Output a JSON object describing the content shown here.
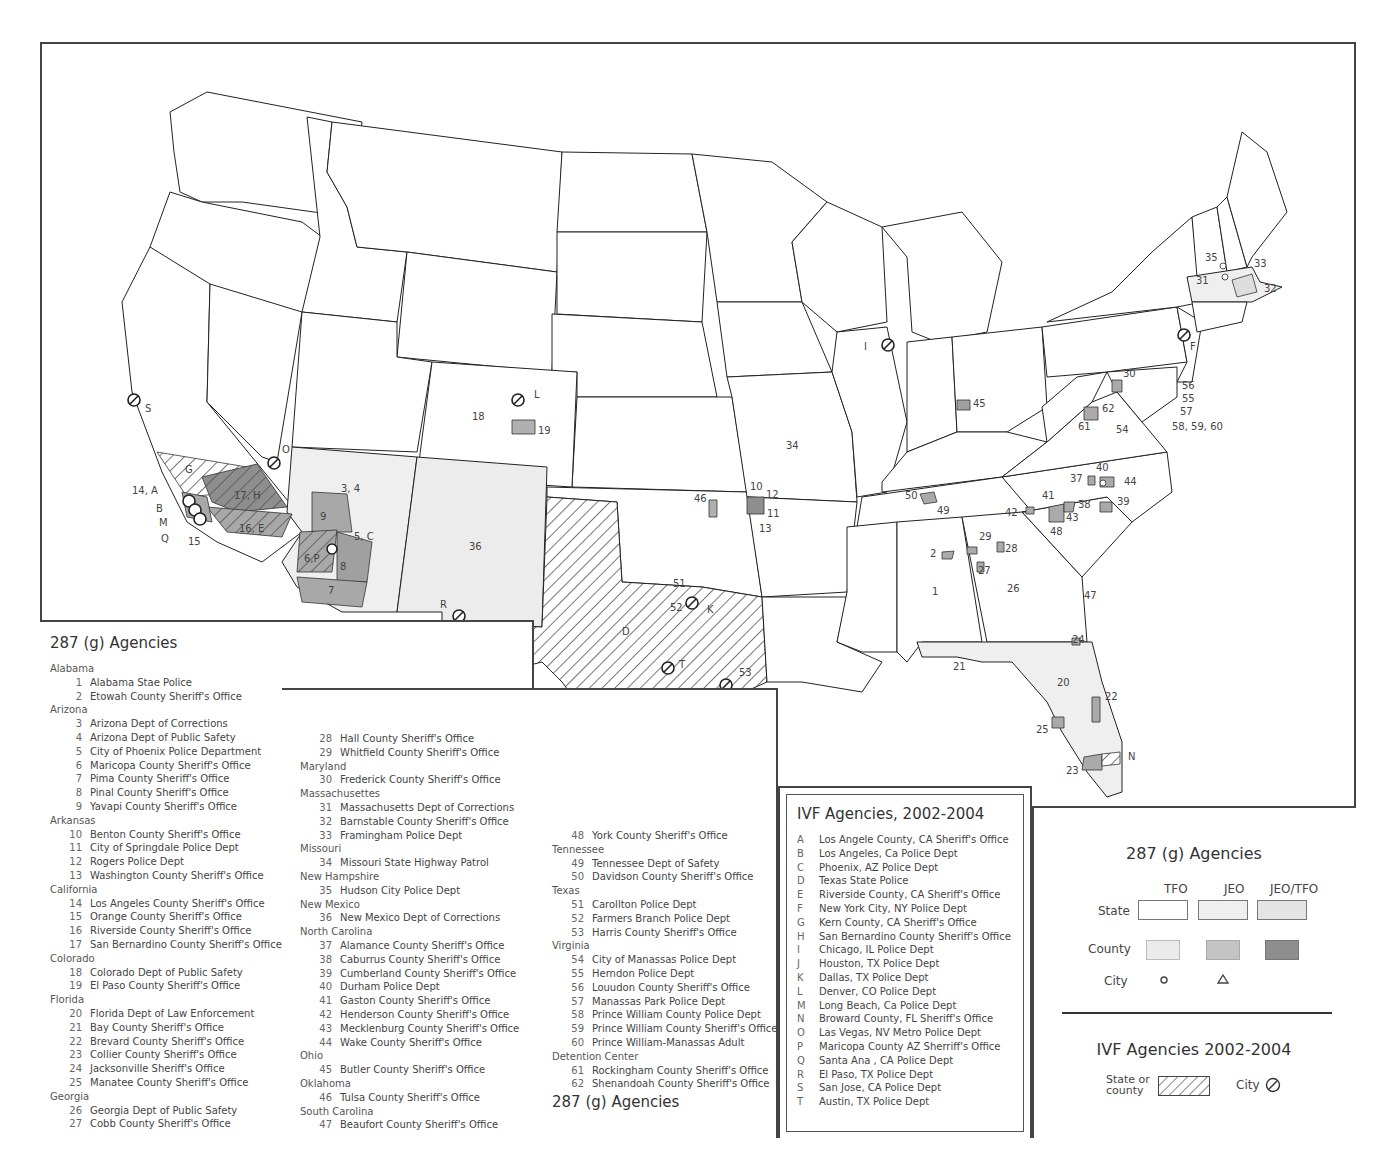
{
  "map": {
    "state_labels": {
      "n18": "18",
      "n19": "19",
      "n36": "36",
      "n34": "34",
      "n3_4": "3, 4",
      "n9": "9",
      "n5C": "5, C",
      "n6P": "6,P",
      "n8": "8",
      "n7": "7",
      "n17H": "17, H",
      "n16E": "16, E",
      "G": "G",
      "n14A": "14, A",
      "B": "B",
      "M": "M",
      "Q": "Q",
      "n15": "15",
      "S": "S",
      "O": "O",
      "L": "L",
      "R": "R",
      "D": "D",
      "T": "T",
      "J": "J",
      "K": "K",
      "n51": "51",
      "n52": "52",
      "n53": "53",
      "n46": "46",
      "n10": "10",
      "n11": "11",
      "n12": "12",
      "n13": "13",
      "I": "I",
      "n45": "45",
      "n1": "1",
      "n2": "2",
      "n26": "26",
      "n27": "27",
      "n28": "28",
      "n29": "29",
      "n49": "49",
      "n50": "50",
      "n42": "42",
      "n41": "41",
      "n43": "43",
      "n48": "48",
      "n38": "38",
      "n37": "37",
      "n40": "40",
      "n44": "44",
      "n39": "39",
      "n47": "47",
      "n20": "20",
      "n21": "21",
      "n22": "22",
      "n23": "23",
      "n24": "24",
      "n25": "25",
      "N": "N",
      "n30": "30",
      "n61": "61",
      "n62": "62",
      "n54": "54",
      "n55": "55",
      "n56": "56",
      "n57": "57",
      "n58_60": "58, 59, 60",
      "F": "F",
      "n31": "31",
      "n32": "32",
      "n33": "33",
      "n35": "35"
    }
  },
  "agencies_287g": {
    "title": "287 (g) Agencies",
    "footer_title": "287 (g) Agencies",
    "columns": [
      [
        {
          "state": "Alabama"
        },
        {
          "num": "1",
          "name": "Alabama Stae Police"
        },
        {
          "num": "2",
          "name": "Etowah County Sheriff's Office"
        },
        {
          "state": "Arizona"
        },
        {
          "num": "3",
          "name": "Arizona Dept of Corrections"
        },
        {
          "num": "4",
          "name": "Arizona Dept of Public Safety"
        },
        {
          "num": "5",
          "name": "City of Phoenix Police Department"
        },
        {
          "num": "6",
          "name": "Maricopa County Sheriff's Office"
        },
        {
          "num": "7",
          "name": "Pima County Sheriff's Office"
        },
        {
          "num": "8",
          "name": "Pinal County Sheriff's Office"
        },
        {
          "num": "9",
          "name": "Yavapi County Sheriff's Office"
        },
        {
          "state": "Arkansas"
        },
        {
          "num": "10",
          "name": "Benton County Sheriff's Office"
        },
        {
          "num": "11",
          "name": "City of Springdale Police Dept"
        },
        {
          "num": "12",
          "name": "Rogers Police Dept"
        },
        {
          "num": "13",
          "name": "Washington County Sheriff's Office"
        },
        {
          "state": "California"
        },
        {
          "num": "14",
          "name": "Los Angeles County Sheriff's Office"
        },
        {
          "num": "15",
          "name": "Orange County Sheriff's Office"
        },
        {
          "num": "16",
          "name": "Riverside County Sheriff's Office"
        },
        {
          "num": "17",
          "name": "San Bernardino County Sheriff's Office"
        },
        {
          "state": "Colorado"
        },
        {
          "num": "18",
          "name": "Colorado Dept of Public Safety"
        },
        {
          "num": "19",
          "name": "El Paso County Sheriff's Office"
        },
        {
          "state": "Florida"
        },
        {
          "num": "20",
          "name": "Florida Dept of Law Enforcement"
        },
        {
          "num": "21",
          "name": "Bay County Sheriff's Office"
        },
        {
          "num": "22",
          "name": "Brevard County Sheriff's Office"
        },
        {
          "num": "23",
          "name": "Collier County Sheriff's Office"
        },
        {
          "num": "24",
          "name": "Jacksonville Sheriff's Office"
        },
        {
          "num": "25",
          "name": "Manatee County Sheriff's Office"
        },
        {
          "state": "Georgia"
        },
        {
          "num": "26",
          "name": "Georgia Dept of Public Safety"
        },
        {
          "num": "27",
          "name": "Cobb County Sheriff's Office"
        }
      ],
      [
        {
          "num": "28",
          "name": "Hall County Sheriff's Office"
        },
        {
          "num": "29",
          "name": "Whitfield County Sheriff's Office"
        },
        {
          "state": "Maryland"
        },
        {
          "num": "30",
          "name": "Frederick County Sheriff's Office"
        },
        {
          "state": "Massachusettes"
        },
        {
          "num": "31",
          "name": "Massachusetts Dept of Corrections"
        },
        {
          "num": "32",
          "name": "Barnstable County Sheriff's Office"
        },
        {
          "num": "33",
          "name": "Framingham Police Dept"
        },
        {
          "state": "Missouri"
        },
        {
          "num": "34",
          "name": "Missouri State Highway Patrol"
        },
        {
          "state": "New Hampshire"
        },
        {
          "num": "35",
          "name": "Hudson City Police Dept"
        },
        {
          "state": "New Mexico"
        },
        {
          "num": "36",
          "name": "New Mexico Dept of Corrections"
        },
        {
          "state": "North Carolina"
        },
        {
          "num": "37",
          "name": "Alamance County Sheriff's Office"
        },
        {
          "num": "38",
          "name": "Caburrus County Sheriff's Office"
        },
        {
          "num": "39",
          "name": "Cumberland County Sheriff's Office"
        },
        {
          "num": "40",
          "name": "Durham Police Dept"
        },
        {
          "num": "41",
          "name": "Gaston County Sheriff's Office"
        },
        {
          "num": "42",
          "name": "Henderson County Sheriff's Office"
        },
        {
          "num": "43",
          "name": "Mecklenburg County Sheriff's Office"
        },
        {
          "num": "44",
          "name": "Wake County Sheriff's Office"
        },
        {
          "state": "Ohio"
        },
        {
          "num": "45",
          "name": "Butler County Sheriff's Office"
        },
        {
          "state": "Oklahoma"
        },
        {
          "num": "46",
          "name": "Tulsa County Sheriff's Office"
        },
        {
          "state": "South Carolina"
        },
        {
          "num": "47",
          "name": "Beaufort County Sheriff's Office"
        }
      ],
      [
        {
          "num": "48",
          "name": "York County Sheriff's Office"
        },
        {
          "state": "Tennessee"
        },
        {
          "num": "49",
          "name": "Tennessee Dept of Safety"
        },
        {
          "num": "50",
          "name": "Davidson County Sheriff's Office"
        },
        {
          "state": "Texas"
        },
        {
          "num": "51",
          "name": "Carollton Police Dept"
        },
        {
          "num": "52",
          "name": "Farmers Branch Police Dept"
        },
        {
          "num": "53",
          "name": "Harris County Sheriff's Office"
        },
        {
          "state": "Virginia"
        },
        {
          "num": "54",
          "name": "City of Manassas Police Dept"
        },
        {
          "num": "55",
          "name": "Herndon Police Dept"
        },
        {
          "num": "56",
          "name": "Louudon County Sheriff's Office"
        },
        {
          "num": "57",
          "name": "Manassas Park Police Dept"
        },
        {
          "num": "58",
          "name": "Prince William County Police Dept"
        },
        {
          "num": "59",
          "name": "Prince William County Sheriff's Office"
        },
        {
          "num": "60",
          "name": "Prince William-Manassas Adult"
        },
        {
          "state": "Detention Center"
        },
        {
          "num": "61",
          "name": "Rockingham County Sheriff's Office"
        },
        {
          "num": "62",
          "name": "Shenandoah County Sheriff's Office"
        }
      ]
    ]
  },
  "ivf_agencies": {
    "title": "IVF Agencies, 2002-2004",
    "items": [
      {
        "letter": "A",
        "name": "Los Angele County, CA Sheriff's Office"
      },
      {
        "letter": "B",
        "name": "Los Angeles, Ca Police Dept"
      },
      {
        "letter": "C",
        "name": "Phoenix, AZ Police Dept"
      },
      {
        "letter": "D",
        "name": "Texas State Police"
      },
      {
        "letter": "E",
        "name": "Riverside County, CA Sheriff's Office"
      },
      {
        "letter": "F",
        "name": "New York City, NY Police Dept"
      },
      {
        "letter": "G",
        "name": "Kern County, CA Sheriff's Office"
      },
      {
        "letter": "H",
        "name": "San Bernardino County Sheriff's Office"
      },
      {
        "letter": "I",
        "name": "Chicago, IL Police Dept"
      },
      {
        "letter": "J",
        "name": "Houston, TX Police Dept"
      },
      {
        "letter": "K",
        "name": "Dallas, TX Police Dept"
      },
      {
        "letter": "L",
        "name": "Denver, CO Police Dept"
      },
      {
        "letter": "M",
        "name": "Long Beach, Ca Police Dept"
      },
      {
        "letter": "N",
        "name": "Broward County, FL Sheriff's Office"
      },
      {
        "letter": "O",
        "name": "Las Vegas, NV Metro Police Dept"
      },
      {
        "letter": "P",
        "name": "Maricopa County AZ Sherriff's Office"
      },
      {
        "letter": "Q",
        "name": "Santa Ana , CA Police Dept"
      },
      {
        "letter": "R",
        "name": "El Paso, TX Police Dept"
      },
      {
        "letter": "S",
        "name": "San Jose, CA Police Dept"
      },
      {
        "letter": "T",
        "name": "Austin, TX Police Dept"
      }
    ]
  },
  "legend": {
    "title_287g": "287 (g) Agencies",
    "col_headers": [
      "TFO",
      "JEO",
      "JEO/TFO"
    ],
    "row_labels": [
      "State",
      "County",
      "City"
    ],
    "colors": {
      "state_tfo": "#ffffff",
      "state_jeo": "#efefef",
      "state_jeo_tfo": "#e4e4e4",
      "county_tfo": "#ebebeb",
      "county_jeo": "#c4c4c4",
      "county_jeo_tfo": "#8e8e8e"
    },
    "city_symbols": [
      "circle",
      "triangle"
    ],
    "title_ivf": "IVF Agencies 2002-2004",
    "ivf_state_label_line1": "State or",
    "ivf_state_label_line2": "county",
    "ivf_city_label": "City"
  }
}
